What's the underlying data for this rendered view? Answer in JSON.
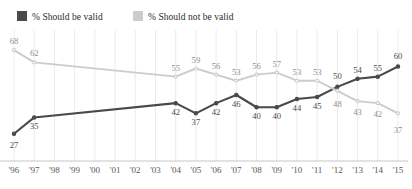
{
  "legend": {
    "items": [
      {
        "id": "valid",
        "label": "% Should be valid",
        "color": "#4a4a4a"
      },
      {
        "id": "notvalid",
        "label": "% Should not be valid",
        "color": "#cccccc"
      }
    ]
  },
  "chart_data": {
    "type": "line",
    "title": "",
    "subtitle": "",
    "xlabel": "",
    "ylabel": "",
    "grid": true,
    "grid_orientation": "vertical",
    "legend_position": "top-left",
    "ylim": [
      20,
      72
    ],
    "categories": [
      "'96",
      "'97",
      "'98",
      "'99",
      "'00",
      "'01",
      "'02",
      "'03",
      "'04",
      "'05",
      "'06",
      "'07",
      "'08",
      "'09",
      "'10",
      "'11",
      "'12",
      "'13",
      "'14",
      "'15"
    ],
    "series": [
      {
        "name": "% Should be valid",
        "color": "#4a4a4a",
        "values": [
          27,
          35,
          null,
          null,
          null,
          null,
          null,
          null,
          42,
          37,
          42,
          46,
          40,
          40,
          44,
          45,
          50,
          54,
          55,
          60
        ],
        "labels": [
          "27",
          "35",
          "",
          "",
          "",
          "",
          "",
          "",
          "42",
          "37",
          "42",
          "46",
          "40",
          "40",
          "44",
          "45",
          "50",
          "54",
          "55",
          "60"
        ]
      },
      {
        "name": "% Should not be valid",
        "color": "#cccccc",
        "values": [
          68,
          62,
          null,
          null,
          null,
          null,
          null,
          null,
          55,
          59,
          56,
          53,
          56,
          57,
          53,
          53,
          48,
          43,
          42,
          37
        ],
        "labels": [
          "68",
          "62",
          "",
          "",
          "",
          "",
          "",
          "",
          "55",
          "59",
          "56",
          "53",
          "56",
          "57",
          "53",
          "53",
          "48",
          "43",
          "42",
          "37"
        ]
      }
    ]
  }
}
